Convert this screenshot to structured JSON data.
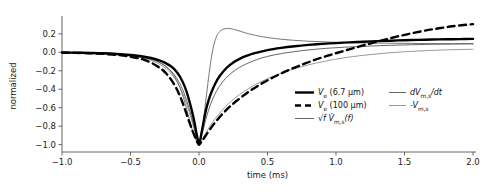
{
  "chart_data": {
    "type": "line",
    "title": "",
    "xlabel": "time (ms)",
    "ylabel": "normalized",
    "xlim": [
      -1.0,
      2.0
    ],
    "ylim": [
      -1.08,
      0.35
    ],
    "grid": false,
    "legend_position": "lower-right-inside",
    "xticks": [
      -1.0,
      -0.5,
      0.0,
      0.5,
      1.0,
      1.5,
      2.0
    ],
    "xtick_labels": [
      "−1.0",
      "−0.5",
      "0.0",
      "0.5",
      "1.0",
      "1.5",
      "2.0"
    ],
    "yticks": [
      0.2,
      0.0,
      -0.2,
      -0.4,
      -0.6,
      -0.8,
      -1.0
    ],
    "ytick_labels": [
      "0.2",
      "0.0",
      "−0.2",
      "−0.4",
      "−0.6",
      "−0.8",
      "−1.0"
    ],
    "series": [
      {
        "name": "Ve_6p7um",
        "legend_label": "Ve (6.7 µm)",
        "color": "#000000",
        "linewidth": 2.4,
        "dash": "solid",
        "x": [
          -1.0,
          -0.9,
          -0.8,
          -0.7,
          -0.6,
          -0.5,
          -0.45,
          -0.4,
          -0.35,
          -0.3,
          -0.25,
          -0.2,
          -0.17,
          -0.14,
          -0.11,
          -0.09,
          -0.07,
          -0.05,
          -0.035,
          -0.02,
          -0.01,
          0.0,
          0.01,
          0.02,
          0.035,
          0.05,
          0.07,
          0.09,
          0.12,
          0.15,
          0.2,
          0.25,
          0.3,
          0.35,
          0.4,
          0.5,
          0.6,
          0.7,
          0.8,
          0.9,
          1.0,
          1.1,
          1.2,
          1.3,
          1.4,
          1.5,
          1.6,
          1.7,
          1.8,
          1.9,
          2.0
        ],
        "y": [
          -0.002,
          -0.004,
          -0.007,
          -0.011,
          -0.018,
          -0.029,
          -0.037,
          -0.048,
          -0.062,
          -0.082,
          -0.112,
          -0.157,
          -0.2,
          -0.262,
          -0.35,
          -0.43,
          -0.53,
          -0.645,
          -0.745,
          -0.865,
          -0.94,
          -1.0,
          -0.94,
          -0.86,
          -0.74,
          -0.63,
          -0.52,
          -0.435,
          -0.335,
          -0.26,
          -0.17,
          -0.11,
          -0.068,
          -0.037,
          -0.012,
          0.024,
          0.048,
          0.066,
          0.08,
          0.091,
          0.1,
          0.108,
          0.115,
          0.121,
          0.126,
          0.131,
          0.135,
          0.138,
          0.141,
          0.143,
          0.145
        ]
      },
      {
        "name": "Ve_100um",
        "legend_label": "Ve (100 µm)",
        "color": "#000000",
        "linewidth": 2.4,
        "dash": "dashed",
        "x": [
          -1.0,
          -0.9,
          -0.8,
          -0.7,
          -0.6,
          -0.55,
          -0.5,
          -0.45,
          -0.4,
          -0.35,
          -0.3,
          -0.27,
          -0.24,
          -0.21,
          -0.18,
          -0.16,
          -0.14,
          -0.12,
          -0.1,
          -0.08,
          -0.06,
          -0.045,
          -0.03,
          -0.02,
          -0.01,
          0.0,
          0.01,
          0.025,
          0.05,
          0.08,
          0.12,
          0.17,
          0.22,
          0.28,
          0.35,
          0.45,
          0.55,
          0.65,
          0.75,
          0.85,
          0.95,
          1.05,
          1.15,
          1.25,
          1.35,
          1.45,
          1.55,
          1.65,
          1.75,
          1.85,
          1.95,
          2.0
        ],
        "y": [
          -0.003,
          -0.006,
          -0.01,
          -0.017,
          -0.028,
          -0.036,
          -0.047,
          -0.062,
          -0.082,
          -0.112,
          -0.155,
          -0.187,
          -0.228,
          -0.282,
          -0.35,
          -0.405,
          -0.47,
          -0.545,
          -0.63,
          -0.715,
          -0.8,
          -0.86,
          -0.915,
          -0.95,
          -0.98,
          -1.0,
          -0.985,
          -0.955,
          -0.9,
          -0.835,
          -0.755,
          -0.67,
          -0.595,
          -0.52,
          -0.44,
          -0.345,
          -0.265,
          -0.195,
          -0.135,
          -0.08,
          -0.032,
          0.012,
          0.055,
          0.095,
          0.135,
          0.172,
          0.205,
          0.235,
          0.26,
          0.282,
          0.298,
          0.305
        ]
      },
      {
        "name": "sqrt_f_Vms_f",
        "legend_label": "√f V̇m,s(f)",
        "color": "#555555",
        "linewidth": 0.9,
        "dash": "solid",
        "x": [
          -1.0,
          -0.9,
          -0.8,
          -0.7,
          -0.6,
          -0.5,
          -0.45,
          -0.4,
          -0.35,
          -0.3,
          -0.26,
          -0.22,
          -0.19,
          -0.16,
          -0.13,
          -0.11,
          -0.09,
          -0.07,
          -0.05,
          -0.035,
          -0.02,
          -0.01,
          0.0,
          0.01,
          0.02,
          0.035,
          0.05,
          0.07,
          0.1,
          0.13,
          0.17,
          0.22,
          0.28,
          0.35,
          0.45,
          0.55,
          0.65,
          0.75,
          0.85,
          0.95,
          1.1,
          1.25,
          1.4,
          1.55,
          1.7,
          1.85,
          2.0
        ],
        "y": [
          -0.002,
          -0.004,
          -0.007,
          -0.012,
          -0.02,
          -0.033,
          -0.043,
          -0.057,
          -0.075,
          -0.103,
          -0.135,
          -0.18,
          -0.226,
          -0.287,
          -0.368,
          -0.438,
          -0.522,
          -0.618,
          -0.725,
          -0.81,
          -0.9,
          -0.955,
          -1.0,
          -0.955,
          -0.9,
          -0.81,
          -0.725,
          -0.625,
          -0.505,
          -0.415,
          -0.325,
          -0.245,
          -0.178,
          -0.122,
          -0.065,
          -0.028,
          -0.002,
          0.018,
          0.033,
          0.045,
          0.058,
          0.068,
          0.076,
          0.082,
          0.087,
          0.09,
          0.093
        ]
      },
      {
        "name": "dVms_dt",
        "legend_label": "dVm,s/dt",
        "color": "#666666",
        "linewidth": 0.9,
        "dash": "solid",
        "x": [
          -1.0,
          -0.9,
          -0.8,
          -0.7,
          -0.6,
          -0.5,
          -0.45,
          -0.4,
          -0.35,
          -0.3,
          -0.27,
          -0.24,
          -0.21,
          -0.18,
          -0.15,
          -0.13,
          -0.11,
          -0.09,
          -0.07,
          -0.05,
          -0.035,
          -0.02,
          -0.01,
          0.0,
          0.01,
          0.02,
          0.035,
          0.05,
          0.07,
          0.09,
          0.11,
          0.13,
          0.15,
          0.17,
          0.19,
          0.21,
          0.23,
          0.25,
          0.27,
          0.3,
          0.34,
          0.38,
          0.45,
          0.55,
          0.65,
          0.8,
          0.95,
          1.1,
          1.3,
          1.5,
          1.7,
          1.85,
          2.0
        ],
        "y": [
          -0.002,
          -0.004,
          -0.006,
          -0.011,
          -0.018,
          -0.03,
          -0.04,
          -0.053,
          -0.072,
          -0.1,
          -0.123,
          -0.155,
          -0.2,
          -0.26,
          -0.345,
          -0.42,
          -0.51,
          -0.615,
          -0.73,
          -0.835,
          -0.9,
          -0.955,
          -0.982,
          -1.0,
          -0.95,
          -0.87,
          -0.71,
          -0.52,
          -0.275,
          -0.06,
          0.09,
          0.178,
          0.223,
          0.246,
          0.256,
          0.258,
          0.256,
          0.25,
          0.243,
          0.229,
          0.21,
          0.195,
          0.172,
          0.15,
          0.135,
          0.12,
          0.111,
          0.105,
          0.1,
          0.097,
          0.094,
          0.093,
          0.092
        ]
      },
      {
        "name": "minus_Vms",
        "legend_label": "-Vm,s",
        "color": "#999999",
        "linewidth": 1.0,
        "dash": "solid",
        "x": [
          -1.0,
          -0.9,
          -0.8,
          -0.7,
          -0.6,
          -0.5,
          -0.45,
          -0.4,
          -0.35,
          -0.3,
          -0.26,
          -0.22,
          -0.19,
          -0.16,
          -0.13,
          -0.11,
          -0.09,
          -0.07,
          -0.05,
          -0.035,
          -0.02,
          -0.01,
          0.0,
          0.012,
          0.03,
          0.05,
          0.08,
          0.12,
          0.17,
          0.22,
          0.28,
          0.35,
          0.45,
          0.55,
          0.65,
          0.75,
          0.85,
          0.95,
          1.05,
          1.2,
          1.35,
          1.5,
          1.65,
          1.8,
          1.9,
          2.0
        ],
        "y": [
          -0.003,
          -0.005,
          -0.009,
          -0.015,
          -0.024,
          -0.039,
          -0.05,
          -0.066,
          -0.088,
          -0.12,
          -0.155,
          -0.205,
          -0.255,
          -0.32,
          -0.405,
          -0.475,
          -0.558,
          -0.653,
          -0.755,
          -0.835,
          -0.915,
          -0.96,
          -1.0,
          -0.975,
          -0.928,
          -0.875,
          -0.8,
          -0.715,
          -0.625,
          -0.55,
          -0.475,
          -0.405,
          -0.32,
          -0.255,
          -0.2,
          -0.155,
          -0.118,
          -0.088,
          -0.062,
          -0.032,
          -0.01,
          0.006,
          0.018,
          0.026,
          0.03,
          0.033
        ]
      }
    ]
  },
  "legend": {
    "items": [
      {
        "id": "ve-6p7",
        "label_main": "V",
        "label_sub": "e",
        "label_rest": " (6.7 µm)",
        "style": "solid-thick-black"
      },
      {
        "id": "ve-100",
        "label_main": "V",
        "label_sub": "e",
        "label_rest": " (100 µm)",
        "style": "dashed-thick-black"
      },
      {
        "id": "sqrt-f-vms",
        "label_main": "√f V̇",
        "label_sub": "m,s",
        "label_rest": "(f)",
        "style": "solid-thin-gray"
      },
      {
        "id": "dvms-dt",
        "label_main": "dV",
        "label_sub": "m,s",
        "label_rest": "/dt",
        "style": "solid-thin-gray"
      },
      {
        "id": "minus-vms",
        "label_main": "-V",
        "label_sub": "m,s",
        "label_rest": "",
        "style": "solid-thin-lightgray"
      }
    ]
  },
  "axes": {
    "xlabel": "time (ms)",
    "ylabel": "normalized"
  }
}
